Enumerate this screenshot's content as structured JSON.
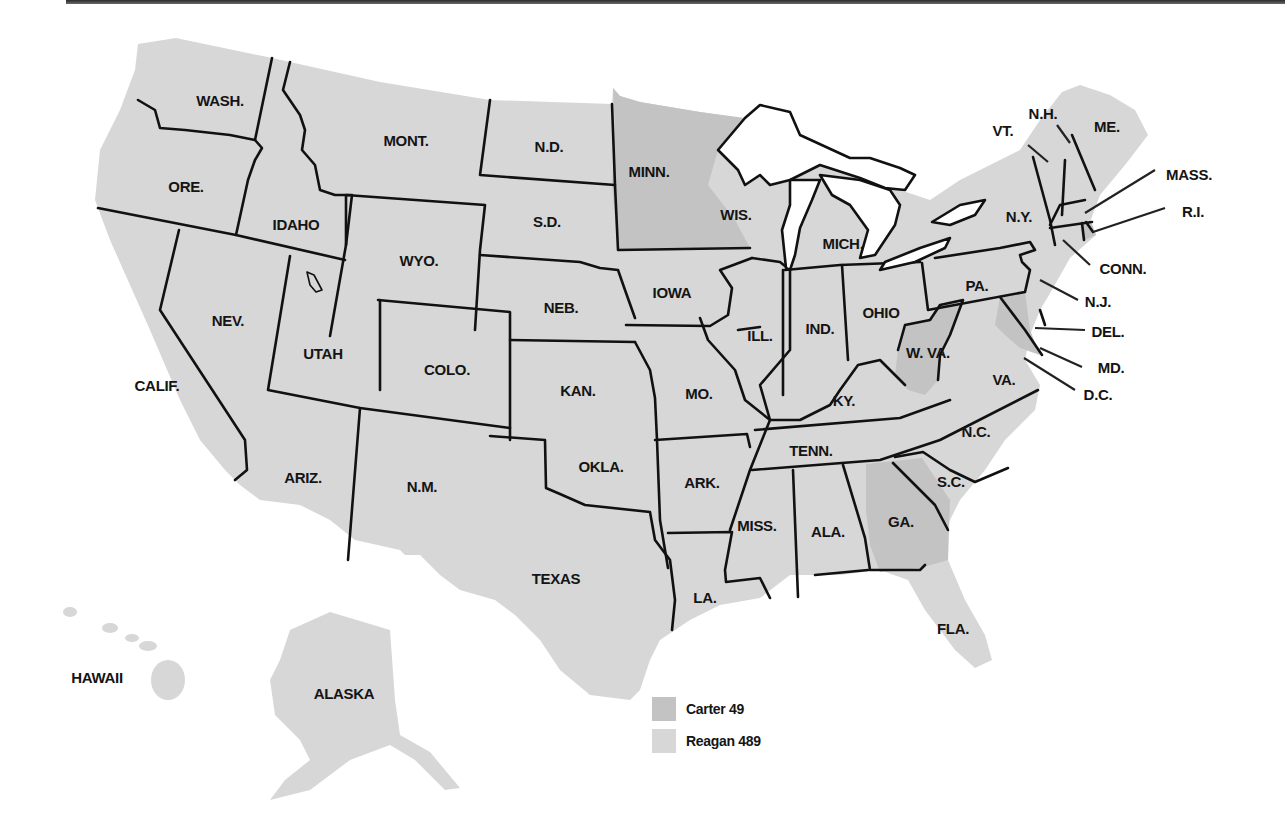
{
  "map": {
    "title": "1980 Presidential Election Electoral Map",
    "colors": {
      "carter": "#c3c3c3",
      "reagan": "#d7d7d7",
      "border": "#111111",
      "background": "#ffffff"
    },
    "legend": [
      {
        "candidate": "Carter",
        "electoral_votes": 49,
        "label": "Carter 49",
        "color": "#c3c3c3"
      },
      {
        "candidate": "Reagan",
        "electoral_votes": 489,
        "label": "Reagan 489",
        "color": "#d7d7d7"
      }
    ],
    "carter_states": [
      "MINN.",
      "W. VA.",
      "MD.",
      "D.C.",
      "R.I.",
      "GA."
    ],
    "labels": [
      {
        "id": "wash",
        "text": "WASH.",
        "x": 220,
        "y": 100
      },
      {
        "id": "ore",
        "text": "ORE.",
        "x": 186,
        "y": 186
      },
      {
        "id": "calif",
        "text": "CALIF.",
        "x": 157,
        "y": 385
      },
      {
        "id": "idaho",
        "text": "IDAHO",
        "x": 296,
        "y": 224
      },
      {
        "id": "nev",
        "text": "NEV.",
        "x": 228,
        "y": 320
      },
      {
        "id": "mont",
        "text": "MONT.",
        "x": 406,
        "y": 140
      },
      {
        "id": "wyo",
        "text": "WYO.",
        "x": 419,
        "y": 260
      },
      {
        "id": "utah",
        "text": "UTAH",
        "x": 323,
        "y": 353
      },
      {
        "id": "colo",
        "text": "COLO.",
        "x": 447,
        "y": 369
      },
      {
        "id": "ariz",
        "text": "ARIZ.",
        "x": 303,
        "y": 477
      },
      {
        "id": "nm",
        "text": "N.M.",
        "x": 422,
        "y": 486
      },
      {
        "id": "nd",
        "text": "N.D.",
        "x": 549,
        "y": 146
      },
      {
        "id": "sd",
        "text": "S.D.",
        "x": 547,
        "y": 221
      },
      {
        "id": "neb",
        "text": "NEB.",
        "x": 561,
        "y": 307
      },
      {
        "id": "kan",
        "text": "KAN.",
        "x": 578,
        "y": 390
      },
      {
        "id": "okla",
        "text": "OKLA.",
        "x": 601,
        "y": 466
      },
      {
        "id": "texas",
        "text": "TEXAS",
        "x": 556,
        "y": 578
      },
      {
        "id": "minn",
        "text": "MINN.",
        "x": 649,
        "y": 171
      },
      {
        "id": "iowa",
        "text": "IOWA",
        "x": 672,
        "y": 292
      },
      {
        "id": "mo",
        "text": "MO.",
        "x": 699,
        "y": 393
      },
      {
        "id": "ark",
        "text": "ARK.",
        "x": 702,
        "y": 482
      },
      {
        "id": "la",
        "text": "LA.",
        "x": 705,
        "y": 597
      },
      {
        "id": "wis",
        "text": "WIS.",
        "x": 736,
        "y": 214
      },
      {
        "id": "ill",
        "text": "ILL.",
        "x": 760,
        "y": 335
      },
      {
        "id": "mich",
        "text": "MICH.",
        "x": 843,
        "y": 243
      },
      {
        "id": "ind",
        "text": "IND.",
        "x": 820,
        "y": 328
      },
      {
        "id": "ohio",
        "text": "OHIO",
        "x": 881,
        "y": 312
      },
      {
        "id": "ky",
        "text": "KY.",
        "x": 844,
        "y": 400
      },
      {
        "id": "tenn",
        "text": "TENN.",
        "x": 811,
        "y": 450
      },
      {
        "id": "miss",
        "text": "MISS.",
        "x": 757,
        "y": 525
      },
      {
        "id": "ala",
        "text": "ALA.",
        "x": 828,
        "y": 531
      },
      {
        "id": "ga",
        "text": "GA.",
        "x": 901,
        "y": 521
      },
      {
        "id": "fla",
        "text": "FLA.",
        "x": 953,
        "y": 628
      },
      {
        "id": "sc",
        "text": "S.C.",
        "x": 951,
        "y": 481
      },
      {
        "id": "nc",
        "text": "N.C.",
        "x": 976,
        "y": 431
      },
      {
        "id": "va",
        "text": "VA.",
        "x": 1004,
        "y": 379
      },
      {
        "id": "wva",
        "text": "W. VA.",
        "x": 928,
        "y": 352
      },
      {
        "id": "pa",
        "text": "PA.",
        "x": 977,
        "y": 285
      },
      {
        "id": "ny",
        "text": "N.Y.",
        "x": 1019,
        "y": 216
      },
      {
        "id": "vt",
        "text": "VT.",
        "x": 1003,
        "y": 130
      },
      {
        "id": "nh",
        "text": "N.H.",
        "x": 1043,
        "y": 113
      },
      {
        "id": "me",
        "text": "ME.",
        "x": 1107,
        "y": 126
      },
      {
        "id": "mass",
        "text": "MASS.",
        "x": 1189,
        "y": 174
      },
      {
        "id": "ri",
        "text": "R.I.",
        "x": 1193,
        "y": 211
      },
      {
        "id": "conn",
        "text": "CONN.",
        "x": 1123,
        "y": 268
      },
      {
        "id": "nj",
        "text": "N.J.",
        "x": 1098,
        "y": 301
      },
      {
        "id": "del",
        "text": "DEL.",
        "x": 1108,
        "y": 331
      },
      {
        "id": "md",
        "text": "MD.",
        "x": 1111,
        "y": 367
      },
      {
        "id": "dc",
        "text": "D.C.",
        "x": 1098,
        "y": 394
      },
      {
        "id": "hawaii",
        "text": "HAWAII",
        "x": 97,
        "y": 677
      },
      {
        "id": "alaska",
        "text": "ALASKA",
        "x": 344,
        "y": 693
      }
    ]
  }
}
